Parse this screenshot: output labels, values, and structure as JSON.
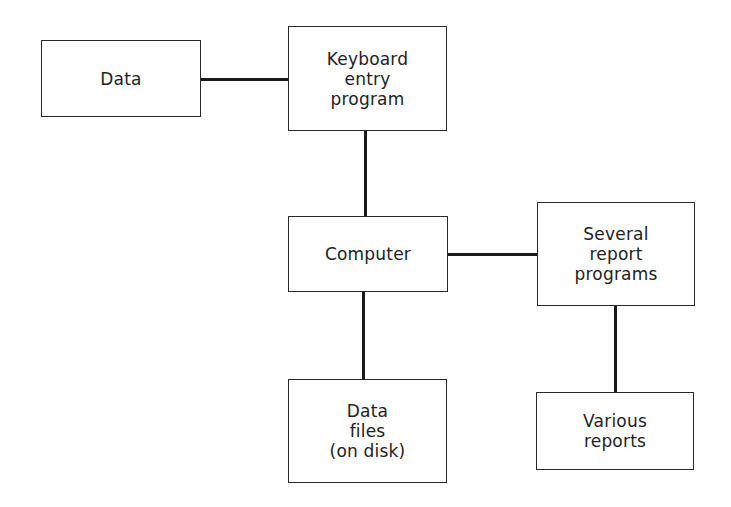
{
  "diagram": {
    "nodes": [
      {
        "id": "data",
        "label": "Data"
      },
      {
        "id": "keyboard",
        "label": "Keyboard\nentry\nprogram"
      },
      {
        "id": "computer",
        "label": "Computer"
      },
      {
        "id": "report_programs",
        "label": "Several\nreport\nprograms"
      },
      {
        "id": "data_files",
        "label": "Data\nfiles\n(on disk)"
      },
      {
        "id": "reports",
        "label": "Various\nreports"
      }
    ],
    "edges": [
      {
        "from": "data",
        "to": "keyboard"
      },
      {
        "from": "keyboard",
        "to": "computer"
      },
      {
        "from": "computer",
        "to": "report_programs"
      },
      {
        "from": "computer",
        "to": "data_files"
      },
      {
        "from": "report_programs",
        "to": "reports"
      }
    ]
  }
}
